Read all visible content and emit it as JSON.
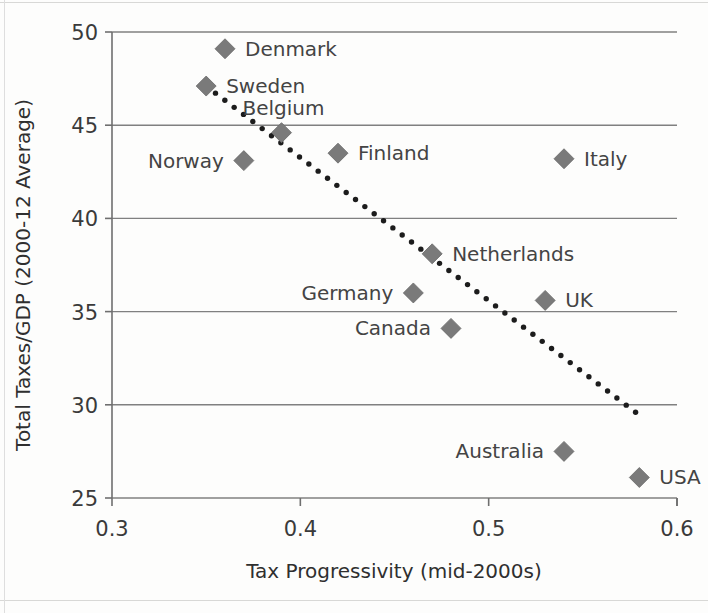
{
  "chart_data": {
    "type": "scatter",
    "title": "",
    "xlabel": "Tax Progressivity (mid-2000s)",
    "ylabel": "Total Taxes/GDP (2000-12 Average)",
    "xlim": [
      0.3,
      0.6
    ],
    "ylim": [
      25,
      50
    ],
    "xticks": [
      "0.3",
      "0.4",
      "0.5",
      "0.6"
    ],
    "xtick_values": [
      0.3,
      0.4,
      0.5,
      0.6
    ],
    "yticks": [
      "50",
      "45",
      "40",
      "35",
      "30",
      "25"
    ],
    "ytick_values": [
      50,
      45,
      40,
      35,
      30,
      25
    ],
    "grid": true,
    "legend": "none",
    "marker_shape": "diamond",
    "marker_color": "#7a7a7a",
    "trendline": {
      "style": "dotted",
      "color": "#1c1c1c",
      "x_start": 0.35,
      "y_start": 47.1,
      "x_end": 0.578,
      "y_end": 29.6
    },
    "points": [
      {
        "label": "Denmark",
        "x": 0.36,
        "y": 49.1,
        "label_side": "right"
      },
      {
        "label": "Sweden",
        "x": 0.35,
        "y": 47.1,
        "label_side": "right"
      },
      {
        "label": "Belgium",
        "x": 0.39,
        "y": 44.6,
        "label_side": "above-right"
      },
      {
        "label": "Norway",
        "x": 0.37,
        "y": 43.1,
        "label_side": "left"
      },
      {
        "label": "Finland",
        "x": 0.42,
        "y": 43.5,
        "label_side": "right"
      },
      {
        "label": "Italy",
        "x": 0.54,
        "y": 43.2,
        "label_side": "right"
      },
      {
        "label": "Netherlands",
        "x": 0.47,
        "y": 38.1,
        "label_side": "right"
      },
      {
        "label": "Germany",
        "x": 0.46,
        "y": 36.0,
        "label_side": "left"
      },
      {
        "label": "UK",
        "x": 0.53,
        "y": 35.6,
        "label_side": "right"
      },
      {
        "label": "Canada",
        "x": 0.48,
        "y": 34.1,
        "label_side": "left"
      },
      {
        "label": "Australia",
        "x": 0.54,
        "y": 27.5,
        "label_side": "left"
      },
      {
        "label": "USA",
        "x": 0.58,
        "y": 26.1,
        "label_side": "right"
      }
    ]
  },
  "axes": {
    "y_title": "Total Taxes/GDP (2000-12 Average)",
    "x_title": "Tax Progressivity (mid-2000s)",
    "y_tick_labels": [
      "50",
      "45",
      "40",
      "35",
      "30",
      "25"
    ],
    "x_tick_labels": [
      "0.3",
      "0.4",
      "0.5",
      "0.6"
    ]
  },
  "labels": {
    "denmark": "Denmark",
    "sweden": "Sweden",
    "belgium": "Belgium",
    "norway": "Norway",
    "finland": "Finland",
    "italy": "Italy",
    "netherlands": "Netherlands",
    "germany": "Germany",
    "uk": "UK",
    "canada": "Canada",
    "australia": "Australia",
    "usa": "USA"
  }
}
